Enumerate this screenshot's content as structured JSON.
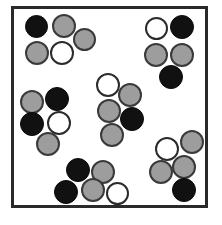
{
  "figure": {
    "canvas": {
      "width": 222,
      "height": 225,
      "background": "#ffffff"
    },
    "frame": {
      "x": 11,
      "y": 6,
      "width": 197,
      "height": 202,
      "border_width": 3,
      "border_color": "#2a2a2a",
      "fill": "#ffffff"
    },
    "token_styles": {
      "black": {
        "fill": "#111111",
        "stroke": "#0a0a0a",
        "label": "black-circle"
      },
      "gray": {
        "fill": "#9d9d9d",
        "stroke": "#3a3a3a",
        "label": "gray-circle"
      },
      "white": {
        "fill": "#ffffff",
        "stroke": "#2b2b2b",
        "label": "white-circle"
      }
    },
    "counts": {
      "total_tokens": 30,
      "black": 10,
      "gray": 13,
      "white": 7,
      "clusters": 6,
      "tokens_per_cluster": 5
    },
    "clusters": [
      {
        "name": "top-left-cluster",
        "tokens": [
          {
            "type": "black",
            "x": 25,
            "y": 15,
            "d": 23
          },
          {
            "type": "gray",
            "x": 52,
            "y": 14,
            "d": 24
          },
          {
            "type": "gray",
            "x": 73,
            "y": 28,
            "d": 23
          },
          {
            "type": "gray",
            "x": 25,
            "y": 41,
            "d": 24
          },
          {
            "type": "white",
            "x": 50,
            "y": 41,
            "d": 24
          }
        ]
      },
      {
        "name": "top-right-cluster",
        "tokens": [
          {
            "type": "white",
            "x": 145,
            "y": 17,
            "d": 23
          },
          {
            "type": "black",
            "x": 170,
            "y": 15,
            "d": 24
          },
          {
            "type": "gray",
            "x": 144,
            "y": 43,
            "d": 24
          },
          {
            "type": "gray",
            "x": 170,
            "y": 43,
            "d": 24
          },
          {
            "type": "black",
            "x": 159,
            "y": 65,
            "d": 24
          }
        ]
      },
      {
        "name": "center-cluster",
        "tokens": [
          {
            "type": "white",
            "x": 96,
            "y": 73,
            "d": 24
          },
          {
            "type": "gray",
            "x": 118,
            "y": 83,
            "d": 24
          },
          {
            "type": "gray",
            "x": 97,
            "y": 99,
            "d": 24
          },
          {
            "type": "black",
            "x": 120,
            "y": 107,
            "d": 24
          },
          {
            "type": "gray",
            "x": 100,
            "y": 123,
            "d": 24
          }
        ]
      },
      {
        "name": "left-middle-cluster",
        "tokens": [
          {
            "type": "gray",
            "x": 20,
            "y": 90,
            "d": 24
          },
          {
            "type": "black",
            "x": 45,
            "y": 87,
            "d": 24
          },
          {
            "type": "black",
            "x": 20,
            "y": 112,
            "d": 24
          },
          {
            "type": "white",
            "x": 47,
            "y": 111,
            "d": 24
          },
          {
            "type": "gray",
            "x": 36,
            "y": 132,
            "d": 24
          }
        ]
      },
      {
        "name": "bottom-center-cluster",
        "tokens": [
          {
            "type": "black",
            "x": 66,
            "y": 158,
            "d": 24
          },
          {
            "type": "gray",
            "x": 91,
            "y": 160,
            "d": 24
          },
          {
            "type": "black",
            "x": 54,
            "y": 180,
            "d": 24
          },
          {
            "type": "gray",
            "x": 81,
            "y": 178,
            "d": 24
          },
          {
            "type": "white",
            "x": 106,
            "y": 182,
            "d": 23
          }
        ]
      },
      {
        "name": "bottom-right-cluster",
        "tokens": [
          {
            "type": "white",
            "x": 155,
            "y": 137,
            "d": 24
          },
          {
            "type": "gray",
            "x": 180,
            "y": 130,
            "d": 24
          },
          {
            "type": "gray",
            "x": 172,
            "y": 155,
            "d": 24
          },
          {
            "type": "gray",
            "x": 149,
            "y": 160,
            "d": 24
          },
          {
            "type": "black",
            "x": 172,
            "y": 178,
            "d": 24
          }
        ]
      }
    ]
  }
}
